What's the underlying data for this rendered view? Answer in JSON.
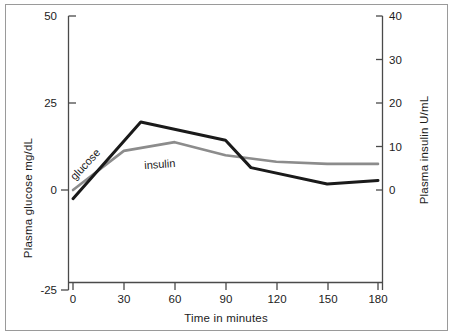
{
  "chart_data": {
    "type": "line",
    "title": "",
    "xlabel": "Time in minutes",
    "ylabel": "Plasma glucose mg/dL",
    "y2label": "Plasma insulin  U/mL",
    "xlim": [
      0,
      180
    ],
    "ylim": [
      -25,
      50
    ],
    "y2lim": [
      0,
      40
    ],
    "xticks": [
      0,
      30,
      60,
      90,
      120,
      150,
      180
    ],
    "xtick_labels": [
      "0",
      "30",
      "60",
      "90",
      "120",
      "150",
      "180"
    ],
    "yticks": [
      -25,
      0,
      25,
      50
    ],
    "ytick_labels": [
      "-25",
      "0",
      "25",
      "50"
    ],
    "y2ticks": [
      0,
      10,
      20,
      30,
      40
    ],
    "y2tick_labels": [
      "0",
      "10",
      "20",
      "30",
      "40"
    ],
    "grid": false,
    "legend_position": "inline-annotation",
    "series": [
      {
        "name": "glucose",
        "axis": "left",
        "units": "mg/dL",
        "color": "#1a1a1a",
        "line_width": 3,
        "x": [
          0,
          40,
          90,
          105,
          150,
          180
        ],
        "values": [
          0,
          21,
          16,
          8.5,
          4,
          5
        ]
      },
      {
        "name": "insulin",
        "axis": "right",
        "units": "U/mL",
        "color": "#8c8c8c",
        "line_width": 2.6,
        "x": [
          0,
          30,
          60,
          90,
          120,
          150,
          180
        ],
        "values": [
          0,
          9,
          11,
          8,
          6.5,
          6,
          6
        ]
      }
    ],
    "annotations": [
      {
        "text": "glucose",
        "x": 22,
        "y": 10,
        "rotation": -47
      },
      {
        "text": "insulin",
        "x": 63,
        "y": 5.6,
        "rotation": -4
      }
    ]
  },
  "axes": {
    "left_title": "Plasma glucose mg/dL",
    "right_title": "Plasma insulin  U/mL",
    "x_title": "Time in minutes"
  },
  "colors": {
    "glucose": "#1a1a1a",
    "insulin": "#8c8c8c",
    "axis": "#4a4a4a",
    "frame": "#9a9a9a",
    "text": "#1c1c1c",
    "background": "#ffffff"
  }
}
